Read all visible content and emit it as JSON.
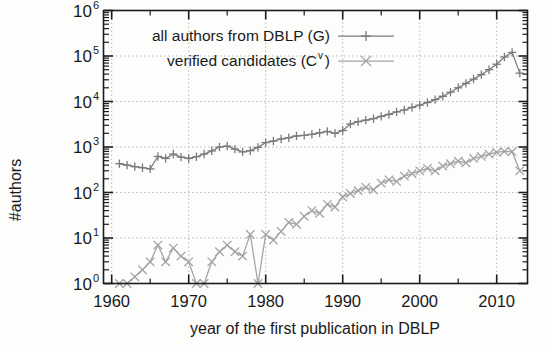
{
  "chart_data": {
    "type": "line",
    "title": "",
    "xlabel": "year of the first publication in DBLP",
    "ylabel": "#authors",
    "xlim": [
      1959,
      2014
    ],
    "ylim": [
      1,
      1000000
    ],
    "yscale": "log",
    "xticks": [
      1960,
      1970,
      1980,
      1990,
      2000,
      2010
    ],
    "xtick_labels": [
      "1960",
      "1970",
      "1980",
      "1990",
      "2000",
      "2010"
    ],
    "yticks": [
      1,
      10,
      100,
      1000,
      10000,
      100000,
      1000000
    ],
    "ytick_labels": [
      "10^0",
      "10^1",
      "10^2",
      "10^3",
      "10^4",
      "10^5",
      "10^6"
    ],
    "ytick_mantissa": [
      "10",
      "10",
      "10",
      "10",
      "10",
      "10",
      "10"
    ],
    "ytick_exponent": [
      "0",
      "1",
      "2",
      "3",
      "4",
      "5",
      "6"
    ],
    "grid": true,
    "grid_style": "dotted",
    "legend_position": "top-left-inside",
    "series": [
      {
        "name": "all authors from DBLP (G)",
        "name_base": "all authors from DBLP (G)",
        "name_sup": "",
        "marker": "plus",
        "color": "#7a7a7a",
        "x": [
          1961,
          1962,
          1963,
          1964,
          1965,
          1966,
          1967,
          1968,
          1969,
          1970,
          1971,
          1972,
          1973,
          1974,
          1975,
          1976,
          1977,
          1978,
          1979,
          1980,
          1981,
          1982,
          1983,
          1984,
          1985,
          1986,
          1987,
          1988,
          1989,
          1990,
          1991,
          1992,
          1993,
          1994,
          1995,
          1996,
          1997,
          1998,
          1999,
          2000,
          2001,
          2002,
          2003,
          2004,
          2005,
          2006,
          2007,
          2008,
          2009,
          2010,
          2011,
          2012,
          2013
        ],
        "y": [
          430,
          400,
          370,
          350,
          330,
          620,
          560,
          700,
          600,
          560,
          610,
          700,
          820,
          1000,
          1050,
          900,
          780,
          830,
          980,
          1250,
          1350,
          1500,
          1600,
          1750,
          1800,
          1900,
          2050,
          2200,
          2000,
          2300,
          3200,
          3600,
          3900,
          4200,
          4700,
          5200,
          5900,
          6500,
          7400,
          8300,
          9500,
          11000,
          13000,
          16000,
          20000,
          25000,
          31000,
          39000,
          50000,
          66000,
          95000,
          120000,
          42000
        ]
      },
      {
        "name": "verified candidates (C^v)",
        "name_base": "verified candidates (C",
        "name_sup": "v",
        "name_tail": ")",
        "marker": "cross",
        "color": "#a3a3a3",
        "x": [
          1961,
          1962,
          1963,
          1964,
          1965,
          1966,
          1967,
          1968,
          1969,
          1970,
          1971,
          1972,
          1973,
          1974,
          1975,
          1976,
          1977,
          1978,
          1979,
          1980,
          1981,
          1982,
          1983,
          1984,
          1985,
          1986,
          1987,
          1988,
          1989,
          1990,
          1991,
          1992,
          1993,
          1994,
          1995,
          1996,
          1997,
          1998,
          1999,
          2000,
          2001,
          2002,
          2003,
          2004,
          2005,
          2006,
          2007,
          2008,
          2009,
          2010,
          2011,
          2012,
          2013
        ],
        "y": [
          1,
          1,
          1.4,
          2,
          3,
          7,
          3,
          6,
          4,
          3,
          1,
          1,
          3,
          5,
          7,
          5,
          4,
          12,
          1,
          12,
          9,
          14,
          22,
          20,
          30,
          40,
          35,
          55,
          48,
          80,
          95,
          110,
          130,
          115,
          160,
          190,
          175,
          230,
          260,
          300,
          340,
          300,
          380,
          430,
          490,
          450,
          560,
          620,
          700,
          760,
          800,
          790,
          300
        ]
      }
    ]
  },
  "legend": {
    "entries": [
      {
        "label": "all authors from DBLP (G)",
        "marker": "plus"
      },
      {
        "label": "verified candidates (Cv)",
        "marker": "cross"
      }
    ]
  },
  "axes": {
    "y_axis_title": "#authors",
    "x_axis_title": "year of the first publication in DBLP"
  }
}
